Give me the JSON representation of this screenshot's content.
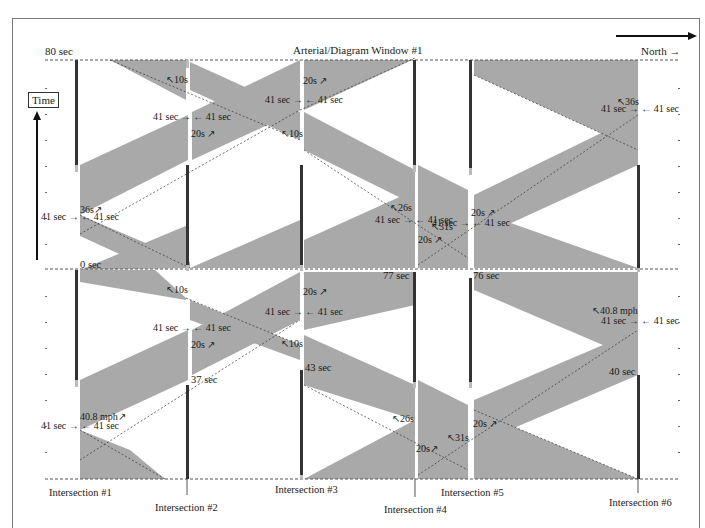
{
  "header": {
    "title": "Arterial/Diagram Window #1",
    "direction": "North →",
    "top_time": "80 sec"
  },
  "axis": {
    "time_label": "Time"
  },
  "intersections": [
    {
      "label": "Intersection #1"
    },
    {
      "label": "Intersection #2"
    },
    {
      "label": "Intersection #3"
    },
    {
      "label": "Intersection #4"
    },
    {
      "label": "Intersection #5"
    },
    {
      "label": "Intersection #6"
    }
  ],
  "offsets": {
    "i1": "0 sec",
    "i2": "37 sec",
    "i3": "43 sec",
    "i4": "77 sec",
    "i5": "76 sec",
    "i6": "40 sec"
  },
  "labels": {
    "green_41_in": "41 sec →",
    "green_41_out": "← 41 sec",
    "speed": "40.8 mph",
    "b36": "36s",
    "b10": "10s",
    "b20": "20s",
    "b26": "26s",
    "b31": "31s",
    "up_arrow": "↗",
    "down_arrow": "↖"
  },
  "colors": {
    "band": "#a9a9a9",
    "red_bar": "#333333",
    "dash": "#555555"
  }
}
